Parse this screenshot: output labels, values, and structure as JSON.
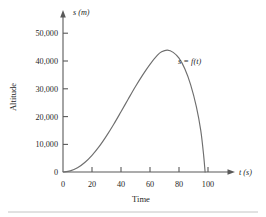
{
  "chart_data": {
    "type": "line",
    "title": "",
    "subtitle": "",
    "xlabel": "Time",
    "ylabel": "Altitude",
    "x_axis_unit": "t (s)",
    "y_axis_unit": "s (m)",
    "xlim": [
      0,
      110
    ],
    "ylim": [
      0,
      55000
    ],
    "grid": false,
    "legend": null,
    "x_ticks": [
      0,
      20,
      40,
      60,
      80,
      100
    ],
    "x_tick_labels": [
      "0",
      "20",
      "40",
      "60",
      "80",
      "100"
    ],
    "y_ticks": [
      0,
      10000,
      20000,
      30000,
      40000,
      50000
    ],
    "y_tick_labels": [
      "0",
      "10,000",
      "20,000",
      "30,000",
      "40,000",
      "50,000"
    ],
    "origin_label": "0",
    "annotations": [
      {
        "text": "s = f(t)",
        "x": 75,
        "y": 41000
      }
    ],
    "series": [
      {
        "name": "s = f(t)",
        "color": "#6e6e6e",
        "x": [
          0,
          5,
          10,
          15,
          20,
          25,
          30,
          35,
          40,
          45,
          50,
          55,
          60,
          65,
          68,
          72,
          76,
          80,
          84,
          88,
          92,
          95,
          97,
          98
        ],
        "y": [
          0,
          400,
          1500,
          3400,
          6000,
          9200,
          13000,
          17200,
          21700,
          26300,
          30800,
          35000,
          38800,
          42000,
          43300,
          43900,
          43100,
          41000,
          37200,
          31500,
          23500,
          15000,
          6000,
          0
        ]
      }
    ]
  },
  "figure": {
    "peak_value": "43,900",
    "peak_time": "72"
  }
}
